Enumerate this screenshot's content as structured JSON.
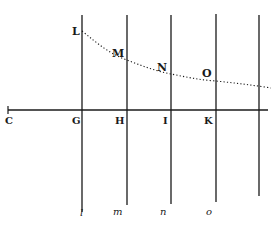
{
  "figure": {
    "axis": {
      "label_left": "C",
      "x_start": 8,
      "x_end": 268,
      "y": 110
    },
    "verticals": [
      {
        "x": 82,
        "top": 15,
        "bottom": 212,
        "upper_label": "L",
        "axis_label": "G",
        "lower_label": "l",
        "curve_y": 31
      },
      {
        "x": 127,
        "top": 15,
        "bottom": 205,
        "upper_label": "M",
        "axis_label": "H",
        "lower_label": "m",
        "curve_y": 60
      },
      {
        "x": 171,
        "top": 15,
        "bottom": 204,
        "upper_label": "N",
        "axis_label": "I",
        "lower_label": "n",
        "curve_y": 74
      },
      {
        "x": 216,
        "top": 14,
        "bottom": 202,
        "upper_label": "O",
        "axis_label": "K",
        "lower_label": "o",
        "curve_y": 81
      },
      {
        "x": 259,
        "top": 15,
        "bottom": 196,
        "upper_label": "",
        "axis_label": "",
        "lower_label": "",
        "curve_y": 86
      }
    ],
    "curve": {
      "style": "dotted",
      "end_x": 271,
      "end_y": 88
    },
    "colors": {
      "ink": "#1a1a1a",
      "background": "#ffffff"
    }
  }
}
